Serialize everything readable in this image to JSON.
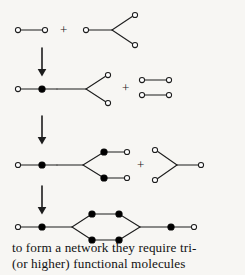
{
  "figure": {
    "background_color": "#f7f6f3",
    "ink_color": "#1c1c1c",
    "open_circle_fill": "#ffffff",
    "filled_dot_color": "#000000",
    "width": 245,
    "height": 275
  },
  "caption": {
    "line1": "to form a network they require tri-",
    "line2": "(or higher) functional molecules"
  },
  "symbols": {
    "plus": "+",
    "open_circle_meaning": "unreacted functional group",
    "filled_dot_meaning": "reacted bond / junction",
    "arrow_meaning": "reaction proceeds to next stage"
  },
  "rows": [
    {
      "id": "row-1",
      "label": "reactants: bifunctional molecule plus trifunctional molecule",
      "plus_label": "+",
      "plus_x": 62,
      "plus_y": 22,
      "species": [
        {
          "name": "bifunctional-molecule",
          "type": "linear",
          "open_circles": 2,
          "filled_dots": 0
        },
        {
          "name": "trifunctional-molecule",
          "type": "branched",
          "open_circles": 3,
          "filled_dots": 0
        }
      ]
    },
    {
      "id": "row-2",
      "label": "first adduct plus two bifunctional molecules",
      "plus_label": "+",
      "plus_x": 121,
      "plus_y": 86,
      "species": [
        {
          "name": "branched-adduct",
          "type": "branched",
          "open_circles": 3,
          "filled_dots": 1
        },
        {
          "name": "bifunctional-molecule",
          "type": "linear",
          "open_circles": 2,
          "filled_dots": 0
        },
        {
          "name": "bifunctional-molecule",
          "type": "linear",
          "open_circles": 2,
          "filled_dots": 0
        }
      ]
    },
    {
      "id": "row-3",
      "label": "extended branched oligomer plus trifunctional molecule",
      "plus_label": "+",
      "plus_x": 131,
      "plus_y": 164,
      "species": [
        {
          "name": "extended-branched-oligomer",
          "type": "branched",
          "open_circles": 3,
          "filled_dots": 3
        },
        {
          "name": "trifunctional-molecule-mirrored",
          "type": "branched",
          "open_circles": 3,
          "filled_dots": 0
        }
      ]
    },
    {
      "id": "row-4",
      "label": "closed ring network segment",
      "plus_label": "",
      "species": [
        {
          "name": "network-ring",
          "type": "cyclic-network",
          "open_circles": 2,
          "filled_dots": 6
        }
      ]
    }
  ],
  "arrows": [
    {
      "name": "reaction-arrow-1",
      "x": 42,
      "y_start": 42,
      "y_end": 72
    },
    {
      "name": "reaction-arrow-2",
      "x": 42,
      "y_start": 110,
      "y_end": 140
    },
    {
      "name": "reaction-arrow-3",
      "x": 42,
      "y_start": 180,
      "y_end": 210
    }
  ]
}
